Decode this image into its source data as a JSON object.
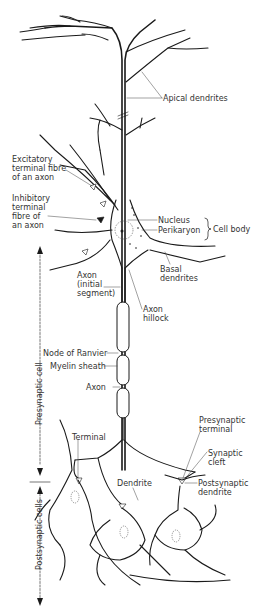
{
  "figure": {
    "colors": {
      "ink": "#1a1a1a",
      "label_text": "#333333",
      "background": "#ffffff"
    }
  },
  "labels": {
    "apical_dendrites": "Apical dendrites",
    "excitatory_terminal": [
      "Excitatory",
      "terminal fibre",
      "of an axon"
    ],
    "inhibitory_terminal": [
      "Inhibitory",
      "terminal",
      "fibre of",
      "an axon"
    ],
    "nucleus": "Nucleus",
    "perikaryon": "Perikaryon",
    "cell_body": "Cell body",
    "basal_dendrites": [
      "Basal",
      "dendrites"
    ],
    "axon_initial_segment": [
      "Axon",
      "(initial",
      "segment)"
    ],
    "axon_hillock": [
      "Axon",
      "hillock"
    ],
    "node_of_ranvier": "Node of Ranvier",
    "myelin_sheath": "Myelin sheath",
    "axon": "Axon",
    "terminal": "Terminal",
    "dendrite": "Dendrite",
    "presynaptic_terminal": [
      "Presynaptic",
      "terminal"
    ],
    "synaptic_cleft": [
      "Synaptic",
      "cleft"
    ],
    "postsynaptic_dendrite": [
      "Postsynaptic",
      "dendrite"
    ]
  },
  "side_axis": {
    "presynaptic_cell": "Presynaptic cell",
    "postsynaptic_cells": "Postsynaptic cells"
  }
}
